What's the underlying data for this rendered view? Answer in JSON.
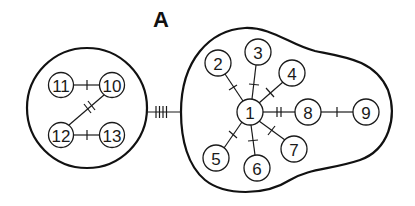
{
  "panel_label": "A",
  "colors": {
    "ink": "#1a1a1a",
    "background": "#ffffff"
  },
  "groups": [
    {
      "id": "left-cluster",
      "shape": "circle",
      "cx": 87,
      "cy": 108,
      "r": 60,
      "nodes": [
        "10",
        "11",
        "12",
        "13"
      ]
    },
    {
      "id": "right-cluster",
      "shape": "blob",
      "nodes": [
        "1",
        "2",
        "3",
        "4",
        "5",
        "6",
        "7",
        "8",
        "9"
      ]
    }
  ],
  "nodes": [
    {
      "id": "1",
      "label": "1",
      "x": 250,
      "y": 112
    },
    {
      "id": "2",
      "label": "2",
      "x": 218,
      "y": 63
    },
    {
      "id": "3",
      "label": "3",
      "x": 258,
      "y": 52
    },
    {
      "id": "4",
      "label": "4",
      "x": 292,
      "y": 73
    },
    {
      "id": "5",
      "label": "5",
      "x": 216,
      "y": 158
    },
    {
      "id": "6",
      "label": "6",
      "x": 257,
      "y": 168
    },
    {
      "id": "7",
      "label": "7",
      "x": 294,
      "y": 149
    },
    {
      "id": "8",
      "label": "8",
      "x": 308,
      "y": 112
    },
    {
      "id": "9",
      "label": "9",
      "x": 366,
      "y": 112
    },
    {
      "id": "10",
      "label": "10",
      "x": 112,
      "y": 85
    },
    {
      "id": "11",
      "label": "11",
      "x": 61,
      "y": 85
    },
    {
      "id": "12",
      "label": "12",
      "x": 61,
      "y": 135
    },
    {
      "id": "13",
      "label": "13",
      "x": 112,
      "y": 135
    }
  ],
  "edges": [
    {
      "from": "1",
      "to": "2",
      "ticks": 1
    },
    {
      "from": "1",
      "to": "3",
      "ticks": 1
    },
    {
      "from": "1",
      "to": "4",
      "ticks": 1
    },
    {
      "from": "1",
      "to": "5",
      "ticks": 1
    },
    {
      "from": "1",
      "to": "6",
      "ticks": 1
    },
    {
      "from": "1",
      "to": "7",
      "ticks": 1
    },
    {
      "from": "1",
      "to": "8",
      "ticks": 2
    },
    {
      "from": "8",
      "to": "9",
      "ticks": 1
    },
    {
      "from": "11",
      "to": "10",
      "ticks": 1
    },
    {
      "from": "10",
      "to": "12",
      "ticks": 2
    },
    {
      "from": "12",
      "to": "13",
      "ticks": 1
    }
  ],
  "group_links": [
    {
      "from": "left-cluster",
      "to": "right-cluster",
      "ticks": 4
    }
  ]
}
